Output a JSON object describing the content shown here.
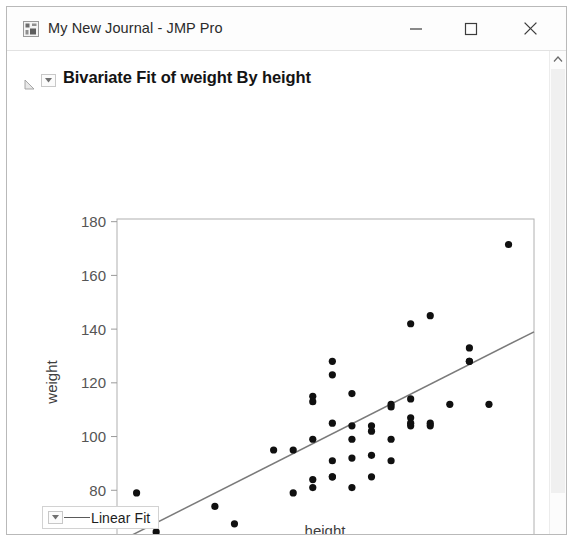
{
  "window": {
    "title": "My New Journal - JMP Pro",
    "app_icon": "jmp-app-icon",
    "controls": {
      "minimize": "Minimize",
      "maximize": "Maximize",
      "close": "Close"
    }
  },
  "report": {
    "title": "Bivariate Fit of weight By height",
    "disclosure_icon": "disclosure-triangle-icon",
    "menu_icon": "chevron-down-icon"
  },
  "legend": {
    "menu_icon": "chevron-down-icon",
    "label": "Linear Fit",
    "line_color": "#5a5a5a"
  },
  "scrollbar": {
    "up_arrow_icon": "chevron-up-icon"
  },
  "colors": {
    "point": "#101010",
    "fit_line": "#7a7a7a",
    "axis": "#9a9a9a",
    "frame": "#b0b0b0",
    "tick_label": "#555555"
  },
  "chart_data": {
    "type": "scatter",
    "title": "Bivariate Fit of weight By height",
    "xlabel": "height",
    "ylabel": "weight",
    "xlim": [
      50,
      71.3
    ],
    "ylim": [
      60,
      181
    ],
    "xticks": [
      50,
      55,
      60,
      65,
      70
    ],
    "yticks": [
      60,
      80,
      100,
      120,
      140,
      160,
      180
    ],
    "grid": false,
    "legend_position": "below-plot",
    "series": [
      {
        "name": "weight vs height",
        "marker": "filled-circle",
        "points": [
          [
            51,
            79
          ],
          [
            52,
            64.5
          ],
          [
            55,
            74
          ],
          [
            56,
            67.5
          ],
          [
            58,
            95
          ],
          [
            59,
            79
          ],
          [
            59,
            95
          ],
          [
            60,
            84
          ],
          [
            60,
            113
          ],
          [
            60,
            115
          ],
          [
            60,
            81
          ],
          [
            60,
            99
          ],
          [
            61,
            128
          ],
          [
            61,
            123
          ],
          [
            61,
            105
          ],
          [
            61,
            91
          ],
          [
            61,
            85
          ],
          [
            61,
            85
          ],
          [
            62,
            104
          ],
          [
            62,
            116
          ],
          [
            62,
            99
          ],
          [
            62,
            92
          ],
          [
            62,
            81
          ],
          [
            63,
            102
          ],
          [
            63,
            104
          ],
          [
            63,
            93
          ],
          [
            63,
            85
          ],
          [
            64,
            99
          ],
          [
            64,
            111
          ],
          [
            64,
            112
          ],
          [
            64,
            91
          ],
          [
            65,
            142
          ],
          [
            65,
            114
          ],
          [
            65,
            107
          ],
          [
            65,
            104
          ],
          [
            65,
            105
          ],
          [
            66,
            145
          ],
          [
            66,
            104
          ],
          [
            66,
            105
          ],
          [
            67,
            112
          ],
          [
            68,
            133
          ],
          [
            68,
            128
          ],
          [
            68,
            128
          ],
          [
            69,
            112
          ],
          [
            70,
            171.5
          ]
        ]
      }
    ],
    "fit": {
      "name": "Linear Fit",
      "type": "line",
      "endpoints": [
        [
          50,
          60.5
        ],
        [
          71.3,
          139
        ]
      ],
      "color": "#7a7a7a"
    }
  }
}
